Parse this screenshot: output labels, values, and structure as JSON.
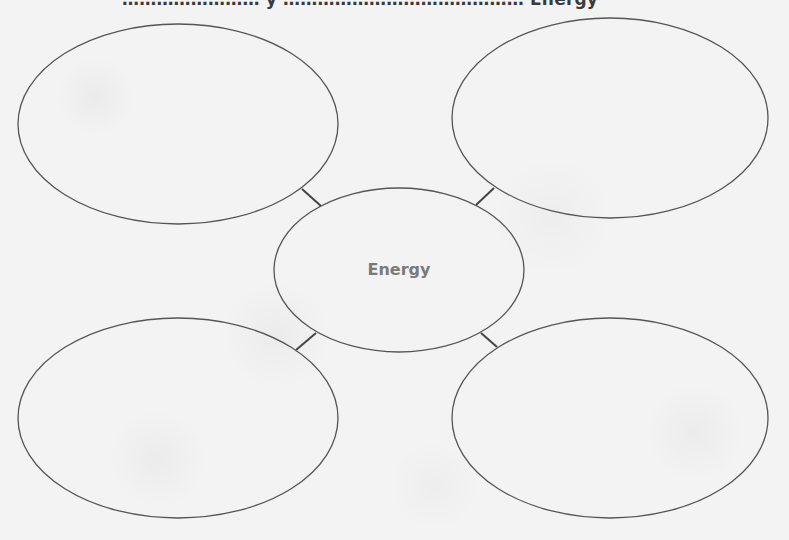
{
  "header": {
    "instruction_text_clipped": "…………………… y …………………………………… Energy"
  },
  "diagram": {
    "type": "bubble-map",
    "center": {
      "label": "Energy",
      "text_color": "#7a7a7a",
      "cx": 399,
      "cy": 270,
      "rx": 125,
      "ry": 82
    },
    "outer_bubbles": [
      {
        "position": "top-left",
        "label": "",
        "cx": 178,
        "cy": 124,
        "rx": 160,
        "ry": 100
      },
      {
        "position": "top-right",
        "label": "",
        "cx": 610,
        "cy": 118,
        "rx": 158,
        "ry": 100
      },
      {
        "position": "bottom-left",
        "label": "",
        "cx": 178,
        "cy": 418,
        "rx": 160,
        "ry": 100
      },
      {
        "position": "bottom-right",
        "label": "",
        "cx": 610,
        "cy": 418,
        "rx": 158,
        "ry": 100
      }
    ],
    "connectors": [
      {
        "from": "top-left",
        "x1": 302,
        "y1": 189,
        "x2": 321,
        "y2": 206
      },
      {
        "from": "top-right",
        "x1": 494,
        "y1": 188,
        "x2": 476,
        "y2": 205
      },
      {
        "from": "bottom-left",
        "x1": 296,
        "y1": 350,
        "x2": 316,
        "y2": 333
      },
      {
        "from": "bottom-right",
        "x1": 481,
        "y1": 333,
        "x2": 497,
        "y2": 347
      }
    ],
    "stroke_color": "#555555",
    "connector_color": "#444444",
    "background_color": "#f3f3f3"
  }
}
